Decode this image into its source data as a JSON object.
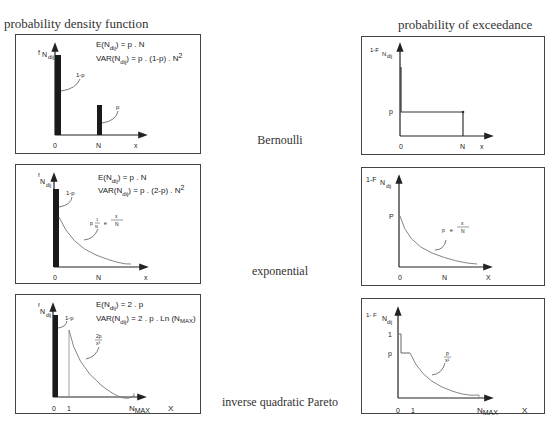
{
  "headers": {
    "left": "probability density function",
    "right": "probability of exceedance"
  },
  "rows": [
    {
      "label": "Bernoulli",
      "pdf": {
        "y_label": "f",
        "y_sub": "N",
        "y_subsub": "dij",
        "formula_mean": "E(N dij) = p . N",
        "formula_var": "VAR(N dij) = p . (1-p) . N 2",
        "mean_lhs": "E(N",
        "mean_sub": "dij",
        "mean_rhs": ") =  p . N",
        "var_lhs": "VAR(N",
        "var_sub": "dij",
        "var_rhs": ") =  p . (1-p) . N",
        "var_sup": "2",
        "bar_label_1": "1-p",
        "bar_label_2": "p",
        "x_ticks": [
          "0",
          "N"
        ],
        "x_axis": "x"
      },
      "exceedance": {
        "y_label": "1-F",
        "y_sub": "N",
        "y_subsub": "dij",
        "y_tick": "p",
        "x_ticks": [
          "0",
          "N"
        ],
        "x_axis": "x"
      }
    },
    {
      "label": "exponential",
      "pdf": {
        "y_label": "f",
        "y_sub": "N",
        "y_subsub": "dij",
        "mean_lhs": "E(N",
        "mean_sub": "dij",
        "mean_rhs": ") =  p . N",
        "var_lhs": "VAR(N",
        "var_sub": "dij",
        "var_rhs": ") =  p . (2-p) . N",
        "var_sup": "2",
        "bar_label": "1-p",
        "curve_label": "p · (1/N) · e^(-x/N)",
        "curve_p": "p",
        "curve_num": "1",
        "curve_den": "N",
        "curve_e": "e",
        "curve_exp_num": "x",
        "curve_exp_den": "N",
        "x_ticks": [
          "0",
          "N"
        ],
        "x_axis": "x"
      },
      "exceedance": {
        "y_label": "1-F",
        "y_sub": "N",
        "y_subsub": "dij",
        "y_tick": "P",
        "curve_label": "p · e^(-x/N)",
        "curve_p": "p",
        "curve_e": "e",
        "curve_exp_num": "x",
        "curve_exp_den": "N",
        "x_ticks": [
          "0",
          "N"
        ],
        "x_axis": "X"
      }
    },
    {
      "label": "inverse quadratic Pareto",
      "pdf": {
        "y_label": "f",
        "y_sub": "N",
        "y_subsub": "dij",
        "mean_lhs": "E(N",
        "mean_sub": "dij",
        "mean_rhs": ") =  2 . p",
        "var_lhs": "VAR(N",
        "var_sub": "dij",
        "var_rhs": ") =  2 . p . Ln (N",
        "var_sub2": "MAX",
        "var_close": ")",
        "bar_label": "1-p",
        "curve_num": "2p",
        "curve_den": "x³",
        "x_ticks": [
          "0",
          "1"
        ],
        "x_max": "N",
        "x_max_sub": "MAX",
        "x_axis": "X"
      },
      "exceedance": {
        "y_label": "1- F",
        "y_sub": "N",
        "y_subsub": "dij",
        "y_tick_1": "1",
        "y_tick_p": "p",
        "curve_num": "p",
        "curve_den": "x²",
        "x_ticks": [
          "0",
          "1"
        ],
        "x_max": "N",
        "x_max_sub": "MAX",
        "x_axis": "X"
      }
    }
  ]
}
